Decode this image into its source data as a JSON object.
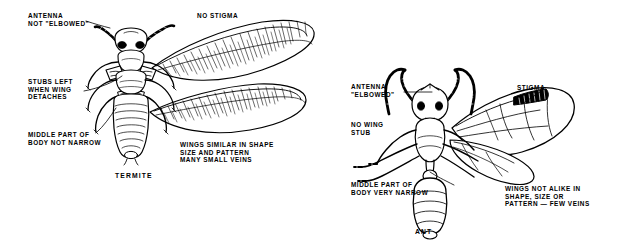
{
  "figure": {
    "background_color": "#ffffff",
    "ink_color": "#000000"
  },
  "termite": {
    "caption": "TERMITE",
    "labels": {
      "antenna": "ANTENNA\nNOT \"ELBOWED\"",
      "stubs": "STUBS LEFT\nWHEN WING\nDETACHES",
      "waist": "MIDDLE PART OF\nBODY NOT NARROW",
      "stigma": "NO STIGMA",
      "wings": "WINGS SIMILAR IN SHAPE\nSIZE AND PATTERN\nMANY SMALL VEINS"
    }
  },
  "ant": {
    "caption": "ANT",
    "labels": {
      "antenna": "ANTENNA\n\"ELBOWED\"",
      "stubs": "NO WING\nSTUB",
      "waist": "MIDDLE PART OF\nBODY VERY NARROW",
      "stigma": "STIGMA",
      "wings": "WINGS NOT ALIKE IN\nSHAPE, SIZE OR\nPATTERN — FEW VEINS"
    }
  }
}
